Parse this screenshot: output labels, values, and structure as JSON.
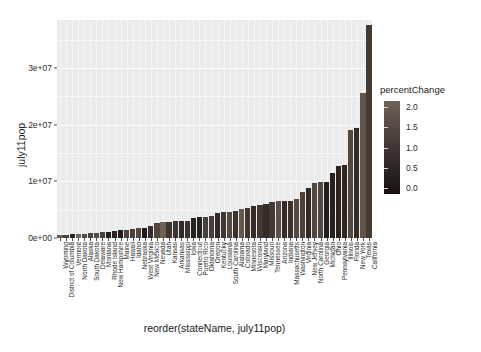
{
  "chart_data": {
    "type": "bar",
    "title": "",
    "xlabel": "reorder(stateName, july11pop)",
    "ylabel": "july11pop",
    "ylim": [
      0,
      38500000
    ],
    "ytick_values": [
      0,
      10000000,
      20000000,
      30000000
    ],
    "ytick_labels": [
      "0e+00",
      "1e+07",
      "2e+07",
      "3e+07"
    ],
    "grid": true,
    "legend": {
      "title": "percentChange",
      "position": "right",
      "type": "continuous-gradient",
      "ticks": [
        2.0,
        1.5,
        1.0,
        0.5,
        0.0
      ],
      "tick_labels": [
        "2.0",
        "1.5",
        "1.0",
        "0.5",
        "0.0"
      ],
      "range": [
        -0.35,
        2.3
      ],
      "low_color": "#14100f",
      "high_color": "#7a6c60"
    },
    "categories": [
      "Wyoming",
      "District of Columbia",
      "Vermont",
      "North Dakota",
      "Alaska",
      "South Dakota",
      "Delaware",
      "Montana",
      "Rhode Island",
      "New Hampshire",
      "Maine",
      "Hawaii",
      "Idaho",
      "Nebraska",
      "West Virginia",
      "New Mexico",
      "Nevada",
      "Utah",
      "Kansas",
      "Arkansas",
      "Mississippi",
      "Iowa",
      "Connecticut",
      "Puerto Rico",
      "Oklahoma",
      "Oregon",
      "Kentucky",
      "Louisiana",
      "South Carolina",
      "Alabama",
      "Colorado",
      "Minnesota",
      "Wisconsin",
      "Maryland",
      "Missouri",
      "Tennessee",
      "Arizona",
      "Indiana",
      "Massachusetts",
      "Washington",
      "Virginia",
      "New Jersey",
      "North Carolina",
      "Georgia",
      "Michigan",
      "Ohio",
      "Pennsylvania",
      "Illinois",
      "Florida",
      "New York",
      "Texas",
      "California"
    ],
    "values": [
      568158,
      617996,
      626431,
      683932,
      722718,
      824082,
      907135,
      998199,
      1050292,
      1318194,
      1328188,
      1374810,
      1584985,
      1842641,
      1855413,
      2082224,
      2723322,
      2817222,
      2871238,
      2937979,
      2978512,
      3062309,
      3580709,
      3706690,
      3791508,
      3871859,
      4369356,
      4574836,
      4679230,
      4802740,
      5116796,
      5344861,
      5711767,
      5828289,
      6010688,
      6403353,
      6482505,
      6516922,
      6587536,
      6830038,
      8096604,
      8821155,
      9656401,
      9815210,
      9876187,
      11544951,
      12742886,
      12869257,
      19057542,
      19465197,
      25674681,
      37691912
    ],
    "percent_change": [
      1.82,
      1.08,
      0.21,
      2.18,
      1.3,
      1.12,
      1.35,
      1.09,
      0.13,
      0.21,
      0.02,
      1.16,
      1.02,
      1.28,
      0.02,
      0.52,
      1.2,
      1.97,
      0.74,
      0.69,
      0.41,
      0.7,
      0.16,
      0.16,
      1.03,
      1.03,
      0.43,
      0.76,
      1.32,
      0.64,
      1.74,
      0.77,
      0.42,
      0.84,
      0.45,
      0.87,
      1.48,
      0.47,
      0.63,
      1.33,
      1.05,
      0.37,
      1.22,
      1.24,
      0.01,
      0.18,
      0.17,
      0.31,
      1.26,
      0.42,
      1.62,
      0.89
    ]
  }
}
